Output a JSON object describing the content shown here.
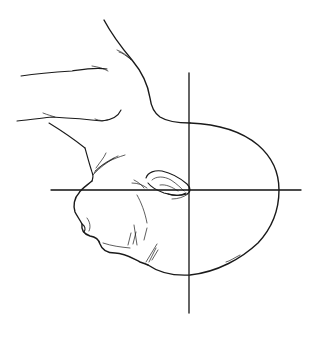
{
  "illustration": {
    "subject": "infant head in profile held by an adult hand, with crosshair reference lines",
    "colors": {
      "background": "#ffffff",
      "ink": "#1a1a1a"
    },
    "crosshair": {
      "vertical": {
        "x": 189,
        "y1": 73,
        "y2": 313
      },
      "horizontal": {
        "y": 190,
        "x1": 51,
        "x2": 301
      }
    }
  }
}
